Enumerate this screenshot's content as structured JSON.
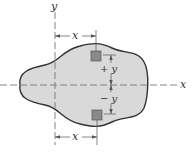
{
  "figure": {
    "axes": {
      "x_label": "x",
      "y_label": "y"
    },
    "dimensions": {
      "top_horizontal": "x",
      "bottom_horizontal": "x",
      "upper_vertical": "+ y",
      "lower_vertical": "− y"
    },
    "elements": {
      "area_fill": "#d9d9d9",
      "outline": "#333333",
      "element_fill": "#8a8a8a"
    }
  }
}
